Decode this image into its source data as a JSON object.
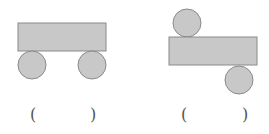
{
  "figures": [
    {
      "name": "figure-left",
      "shapes": {
        "rect": {
          "x": 18,
          "y": 23,
          "w": 88,
          "h": 28
        },
        "circles": [
          {
            "cx": 32,
            "cy": 65,
            "r": 14
          },
          {
            "cx": 92,
            "cy": 65,
            "r": 14
          }
        ]
      },
      "answer": {
        "open": "(",
        "close": ")",
        "value": ""
      }
    },
    {
      "name": "figure-right",
      "shapes": {
        "rect": {
          "x": 169,
          "y": 37,
          "w": 88,
          "h": 28
        },
        "circles": [
          {
            "cx": 187,
            "cy": 23,
            "r": 14
          },
          {
            "cx": 239,
            "cy": 80,
            "r": 14
          }
        ]
      },
      "answer": {
        "open": "(",
        "close": ")",
        "value": ""
      }
    }
  ],
  "colors": {
    "fill": "#c8c8c8",
    "stroke": "#8a8a8a",
    "background": "#ffffff"
  }
}
